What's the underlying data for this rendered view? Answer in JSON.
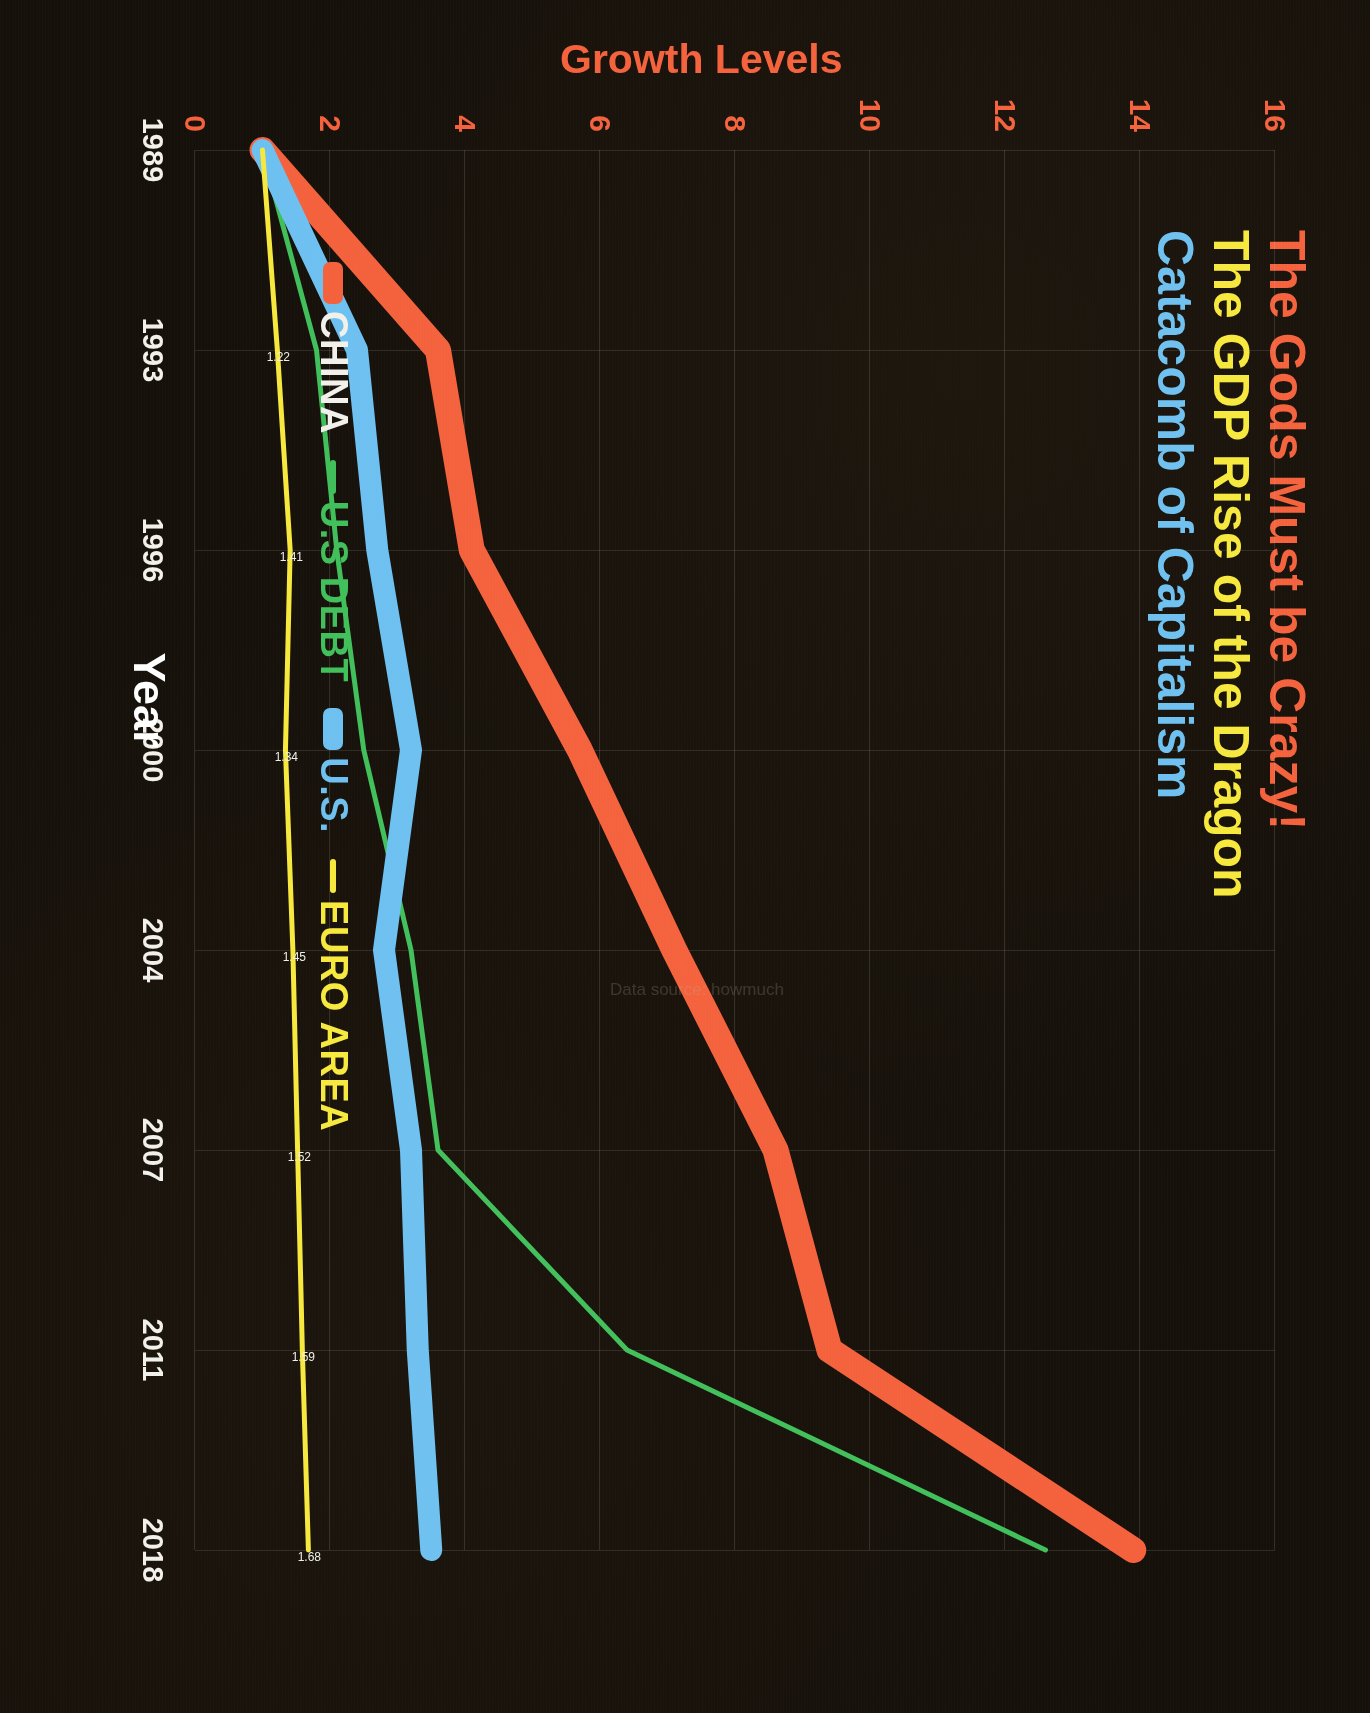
{
  "titles": {
    "line1": "The Gods Must be Crazy!",
    "line2": "The GDP Rise of the Dragon",
    "line3": "Catacomb of Capitalism",
    "color1": "#f4613c",
    "color2": "#f6e83c",
    "color3": "#6cc0f0"
  },
  "watermark": "Data source: howmuch",
  "legend": {
    "items": [
      {
        "label": "CHINA",
        "color": "#f4613c",
        "text_color": "#f2f0ea"
      },
      {
        "label": "U.S DEBT",
        "color": "#3fbf5a",
        "text_color": "#3fbf5a"
      },
      {
        "label": "U.S.",
        "color": "#6cc0f0",
        "text_color": "#6cc0f0"
      },
      {
        "label": "EURO AREA",
        "color": "#f6e83c",
        "text_color": "#f6e83c"
      }
    ]
  },
  "chart_data": {
    "type": "line",
    "xlabel": "Year",
    "ylabel": "Growth Levels",
    "grid": true,
    "legend_position": "bottom-left",
    "x": [
      "1989",
      "1993",
      "1996",
      "2000",
      "2004",
      "2007",
      "2011",
      "2018"
    ],
    "ylim": [
      0,
      16
    ],
    "yticks": [
      0,
      2,
      4,
      6,
      8,
      10,
      12,
      14,
      16
    ],
    "series": [
      {
        "name": "CHINA",
        "color": "#f4613c",
        "values": [
          1.0,
          3.6,
          4.1,
          5.7,
          7.1,
          8.6,
          9.4,
          13.9
        ]
      },
      {
        "name": "U.S DEBT",
        "color": "#3fbf5a",
        "values": [
          1.0,
          1.8,
          2.1,
          2.5,
          3.2,
          3.6,
          6.4,
          12.6
        ]
      },
      {
        "name": "U.S.",
        "color": "#6cc0f0",
        "values": [
          1.0,
          2.4,
          2.7,
          3.2,
          2.8,
          3.2,
          3.3,
          3.5
        ]
      },
      {
        "name": "EURO AREA",
        "color": "#f6e83c",
        "values": [
          1.0,
          1.22,
          1.41,
          1.34,
          1.45,
          1.52,
          1.59,
          1.68
        ]
      }
    ],
    "point_labels": [
      {
        "series": "EURO AREA",
        "x": "1993",
        "text": "1.22"
      },
      {
        "series": "EURO AREA",
        "x": "1996",
        "text": "1.41"
      },
      {
        "series": "EURO AREA",
        "x": "2000",
        "text": "1.34"
      },
      {
        "series": "EURO AREA",
        "x": "2004",
        "text": "1.45"
      },
      {
        "series": "EURO AREA",
        "x": "2007",
        "text": "1.52"
      },
      {
        "series": "EURO AREA",
        "x": "2011",
        "text": "1.59"
      },
      {
        "series": "EURO AREA",
        "x": "2018",
        "text": "1.68"
      }
    ]
  }
}
